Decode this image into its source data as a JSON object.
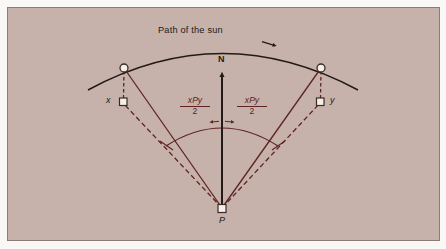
{
  "figure": {
    "title_label": "Path of the sun",
    "north_label": "N",
    "observer_label": "P",
    "point_x_label": "x",
    "point_y_label": "y",
    "angle_left": {
      "numerator": "xPy",
      "denominator": "2"
    },
    "angle_right": {
      "numerator": "xPy",
      "denominator": "2"
    },
    "colors": {
      "panel_background": "#c6b2aa",
      "page_background": "#faf8f6",
      "ray_color": "#5e2322",
      "sun_path_color": "#231a17",
      "north_arrow_color": "#231a17",
      "marker_fill": "#f4efe9",
      "marker_stroke": "#3a2a25",
      "panel_border": "#8d7c76"
    },
    "geometry": {
      "observer_point": {
        "x": 222,
        "y": 208
      },
      "sun_left": {
        "x": 124,
        "y": 68
      },
      "sun_right": {
        "x": 321,
        "y": 68
      },
      "foot_x": {
        "x": 123,
        "y": 102
      },
      "foot_y": {
        "x": 320,
        "y": 102
      },
      "north_arrow_tip": {
        "x": 222,
        "y": 72
      },
      "sun_path_arc_left_end": {
        "x": 88,
        "y": 90
      },
      "sun_path_arc_right_end": {
        "x": 358,
        "y": 90
      },
      "sun_path_arc_apex": {
        "x": 222,
        "y": 41
      },
      "sun_path_arrow": {
        "x": 272,
        "y": 44
      },
      "angle_arc_left_end": {
        "x": 166,
        "y": 146
      },
      "angle_arc_right_end": {
        "x": 278,
        "y": 146
      },
      "angle_arc_apex": {
        "x": 222,
        "y": 121
      }
    }
  }
}
